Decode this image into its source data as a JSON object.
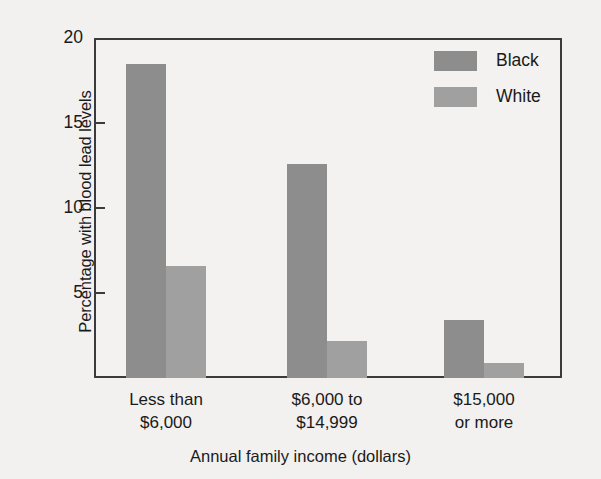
{
  "chart_data": {
    "type": "bar",
    "title": "",
    "subtitle": "",
    "xlabel": "Annual family income (dollars)",
    "ylabel": "Percentage with blood lead levels",
    "categories": [
      "Less than $6,000",
      "$6,000 to $14,999",
      "$15,000 or more"
    ],
    "category_lines": [
      [
        "Less than",
        "$6,000"
      ],
      [
        "$6,000 to",
        "$14,999"
      ],
      [
        "$15,000",
        "or more"
      ]
    ],
    "series": [
      {
        "name": "Black",
        "color": "#8d8d8d",
        "values": [
          18.5,
          12.6,
          3.4
        ]
      },
      {
        "name": "White",
        "color": "#a0a0a0",
        "values": [
          6.6,
          2.2,
          0.9
        ]
      }
    ],
    "ylim": [
      0,
      20
    ],
    "yticks": [
      5,
      10,
      15,
      20
    ],
    "ytick_labels": [
      "5",
      "10",
      "15",
      "20"
    ],
    "grid": false,
    "legend_position": "top-right",
    "legend_entries": [
      "Black",
      "White"
    ]
  },
  "axes": {
    "y_title": "Percentage with blood lead levels",
    "x_title": "Annual family income (dollars)"
  },
  "legend": {
    "items": [
      {
        "label": "Black",
        "color": "#8d8d8d"
      },
      {
        "label": "White",
        "color": "#a0a0a0"
      }
    ]
  },
  "colors": {
    "background": "#f2f1ef",
    "plot_background": "#f3f2f0",
    "frame": "#3b3b3b",
    "black_series": "#8d8d8d",
    "white_series": "#a0a0a0",
    "text": "#1a1a1a"
  }
}
